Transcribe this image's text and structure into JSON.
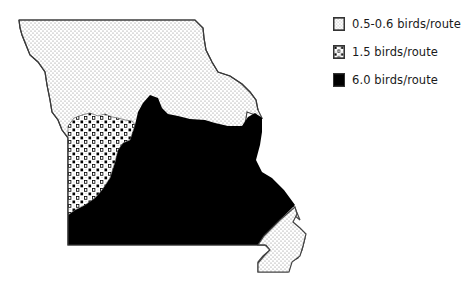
{
  "map": {
    "subject": "Missouri",
    "regions": [
      {
        "id": "low",
        "label": "0.5-0.6 birds/route",
        "pattern": "fine-stipple",
        "areas": [
          "north",
          "southeast-bootheel"
        ]
      },
      {
        "id": "mid",
        "label": "1.5 birds/route",
        "pattern": "coarse-dots-squares",
        "areas": [
          "west-central"
        ]
      },
      {
        "id": "high",
        "label": "6.0 birds/route",
        "pattern": "solid-black",
        "areas": [
          "central-south"
        ]
      }
    ]
  },
  "legend": {
    "items": [
      {
        "label": "0.5-0.6 birds/route",
        "swatch": "fine-stipple"
      },
      {
        "label": "1.5 birds/route",
        "swatch": "coarse-dots-squares"
      },
      {
        "label": "6.0 birds/route",
        "swatch": "solid-black"
      }
    ]
  },
  "colors": {
    "fill_high": "#000000",
    "outline": "#444444",
    "stipple_dot": "#8a8a8a",
    "background": "#ffffff"
  }
}
